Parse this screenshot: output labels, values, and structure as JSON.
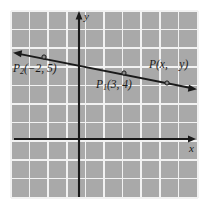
{
  "figure": {
    "type": "coordinate-plane-line-graph",
    "background_color": "#ffffff",
    "panel_color": "#a9a9a9",
    "grid_color": "#f2f2f2",
    "ink_color": "#1a1a1a"
  },
  "axes": {
    "x_label": "x",
    "y_label": "y",
    "origin_px": {
      "x": 79,
      "y": 139
    },
    "x_axis_from_px": {
      "x": 14,
      "y": 139
    },
    "x_axis_to_px": {
      "x": 196,
      "y": 139
    },
    "y_axis_from_px": {
      "x": 79,
      "y": 197
    },
    "y_axis_to_px": {
      "x": 79,
      "y": 12
    },
    "arrowheads": [
      "x-positive",
      "y-positive"
    ]
  },
  "grid": {
    "columns": 10,
    "rows": 10,
    "cell_size_px": 18.6,
    "left_px": 11,
    "top_px": 11,
    "width_px": 187,
    "height_px": 187
  },
  "line": {
    "from_px": {
      "x": 14,
      "y": 53
    },
    "to_px": {
      "x": 196,
      "y": 89
    },
    "arrowheads": [
      "start",
      "end"
    ],
    "stroke_width": 1.8
  },
  "points": [
    {
      "name": "P2",
      "label": "P₂(−2, 5)",
      "label_html": "P<sub>2</sub>(&#8722;2, 5)",
      "coords": {
        "x": -2,
        "y": 5
      },
      "marker_px": {
        "x": 44,
        "y": 57
      }
    },
    {
      "name": "P1",
      "label": "P₁(3, 4)",
      "label_html": "P<sub>1</sub>(3, 4)",
      "coords": {
        "x": 3,
        "y": 4
      },
      "marker_px": {
        "x": 124,
        "y": 73
      }
    },
    {
      "name": "P",
      "label": "P(x,  y)",
      "label_html": "P(x,&#8195;y)",
      "coords": {
        "x": "x",
        "y": "y"
      },
      "marker_px": {
        "x": 167,
        "y": 83
      }
    }
  ],
  "chart_data": {
    "type": "line",
    "title": "",
    "xlabel": "x",
    "ylabel": "y",
    "grid": true,
    "legend": false,
    "series": [
      {
        "name": "line through P1 and P2",
        "points": [
          {
            "x": -2,
            "y": 5,
            "label": "P₂(−2, 5)"
          },
          {
            "x": 3,
            "y": 4,
            "label": "P₁(3, 4)"
          },
          {
            "x": 5,
            "y": 3.6,
            "label": "P(x, y)"
          }
        ]
      }
    ]
  }
}
